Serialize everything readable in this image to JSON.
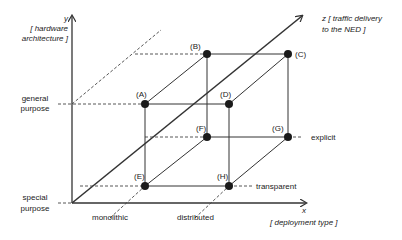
{
  "axes": {
    "y": {
      "letter": "y",
      "title_line1": "[ hardware",
      "title_line2": "architecture ]",
      "ticks": [
        {
          "id": "general",
          "line1": "general",
          "line2": "purpose"
        },
        {
          "id": "special",
          "line1": "special",
          "line2": "purpose"
        }
      ]
    },
    "x": {
      "letter": "x",
      "title": "[ deployment type ]",
      "ticks": [
        {
          "id": "monolithic",
          "label": "monolithic"
        },
        {
          "id": "distributed",
          "label": "distributed"
        }
      ]
    },
    "z": {
      "title_line1": "z [ traffic delivery",
      "title_line2": "to the NED ]",
      "ticks": [
        {
          "id": "explicit",
          "label": "explicit"
        },
        {
          "id": "transparent",
          "label": "transparent"
        }
      ]
    }
  },
  "points": [
    {
      "id": "A",
      "label": "(A)"
    },
    {
      "id": "B",
      "label": "(B)"
    },
    {
      "id": "C",
      "label": "(C)"
    },
    {
      "id": "D",
      "label": "(D)"
    },
    {
      "id": "E",
      "label": "(E)"
    },
    {
      "id": "F",
      "label": "(F)"
    },
    {
      "id": "G",
      "label": "(G)"
    },
    {
      "id": "H",
      "label": "(H)"
    }
  ],
  "colors": {
    "line": "#333333",
    "point": "#1a1a1a",
    "text": "#222222"
  }
}
